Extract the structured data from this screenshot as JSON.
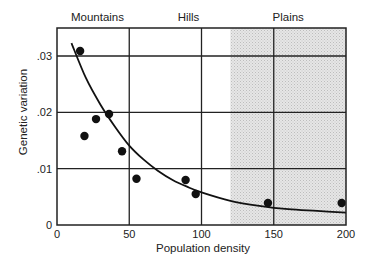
{
  "chart_data": {
    "type": "scatter",
    "title": "",
    "xlabel": "Population density",
    "ylabel": "Genetic variation",
    "xlim": [
      0,
      200
    ],
    "ylim": [
      0,
      0.034
    ],
    "x_ticks": [
      0,
      50,
      100,
      150,
      200
    ],
    "x_tick_labels": [
      "0",
      "50",
      "100",
      "150",
      "200"
    ],
    "y_ticks": [
      0,
      0.01,
      0.02,
      0.03
    ],
    "y_tick_labels": [
      "0",
      ".01",
      ".02",
      ".03"
    ],
    "grid": true,
    "regions": [
      {
        "label": "Mountains",
        "x_start": 0,
        "x_end": 50,
        "label_x": 28,
        "shaded": false
      },
      {
        "label": "Hills",
        "x_start": 50,
        "x_end": 120,
        "label_x": 91,
        "shaded": false
      },
      {
        "label": "Plains",
        "x_start": 120,
        "x_end": 200,
        "label_x": 160,
        "shaded": true
      }
    ],
    "series": [
      {
        "name": "Observed populations",
        "kind": "points",
        "x": [
          16,
          19,
          27,
          36,
          45,
          55,
          89,
          96,
          146,
          197
        ],
        "y": [
          0.0309,
          0.0158,
          0.0188,
          0.0197,
          0.0131,
          0.0082,
          0.008,
          0.0055,
          0.0039,
          0.0039
        ]
      },
      {
        "name": "Fitted curve",
        "kind": "line",
        "x": [
          10,
          20,
          30,
          40,
          50,
          60,
          70,
          80,
          90,
          100,
          120,
          140,
          160,
          180,
          200
        ],
        "y": [
          0.0323,
          0.0261,
          0.0214,
          0.0175,
          0.0141,
          0.0116,
          0.0096,
          0.008,
          0.0068,
          0.0058,
          0.0043,
          0.0034,
          0.0028,
          0.0025,
          0.0022
        ]
      }
    ],
    "colors": {
      "axis": "#222222",
      "grid": "#222222",
      "points": "#111111",
      "curve": "#111111",
      "shade": "#d8d8d8"
    }
  }
}
